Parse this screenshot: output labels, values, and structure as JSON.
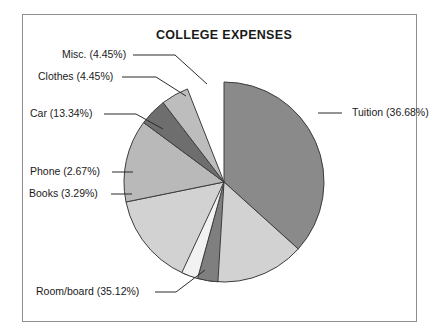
{
  "chart_data": {
    "type": "pie",
    "title": "COLLEGE EXPENSES",
    "xlabel": "",
    "ylabel": "",
    "legend_position": "callout-labels",
    "grid": false,
    "units": "percent",
    "categories": [
      "Tuition",
      "Room/board",
      "Car",
      "Clothes",
      "Misc.",
      "Books",
      "Phone"
    ],
    "values": [
      36.68,
      35.12,
      13.34,
      4.45,
      4.45,
      3.29,
      2.67
    ],
    "slices": [
      {
        "name": "Tuition",
        "value": 36.68,
        "label": "Tuition (36.68%)",
        "color": "#8a8a8a",
        "start_angle": 0,
        "label_x": 352,
        "label_y": 116,
        "label_anchor": "start",
        "leader": "M 318 113 L 342 113"
      },
      {
        "name": "Room/board",
        "value": 35.12,
        "label": "Room/board (35.12%)",
        "color": "#d2d2d2",
        "start_angle": 132.05,
        "label_x": 36,
        "label_y": 295,
        "label_anchor": "start",
        "leader": "M 155 292 L 176 292 L 205 270"
      },
      {
        "name": "Car",
        "value": 13.34,
        "label": "Car (13.34%)",
        "color": "#b9b9b9",
        "start_angle": 258.48,
        "label_x": 30,
        "label_y": 117,
        "label_anchor": "start",
        "leader": "M 104 114 L 136 114 L 163 129"
      },
      {
        "name": "Clothes",
        "value": 4.45,
        "label": "Clothes (4.45%)",
        "color": "#6e6e6e",
        "start_angle": 306.5,
        "label_x": 38,
        "label_y": 80,
        "label_anchor": "start",
        "leader": "M 122 77 L 156 77 L 186 96"
      },
      {
        "name": "Misc.",
        "value": 4.45,
        "label": "Misc. (4.45%)",
        "color": "#bdbdbd",
        "start_angle": 322.52,
        "label_x": 62,
        "label_y": 58,
        "label_anchor": "start",
        "leader": "M 133 55 L 175 55 L 207 84"
      },
      {
        "name": "Books",
        "value": 3.29,
        "label": "Books (3.29%)",
        "color": "#7f7f7f",
        "start_angle": 183.49,
        "label_x": 29,
        "label_y": 197,
        "label_anchor": "start",
        "leader": "M 111 194 L 132 194"
      },
      {
        "name": "Phone",
        "value": 2.67,
        "label": "Phone (2.67%)",
        "color": "#f2f2f2",
        "start_angle": 195.33,
        "label_x": 30,
        "label_y": 175,
        "label_anchor": "start",
        "leader": "M 112 172 L 133 172"
      }
    ],
    "geometry": {
      "center_x": 224,
      "center_y": 182,
      "radius": 100
    },
    "title_x": 224,
    "title_y": 39
  }
}
